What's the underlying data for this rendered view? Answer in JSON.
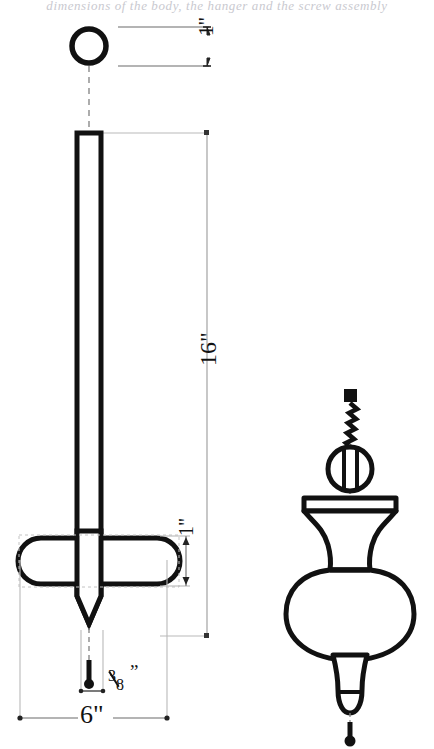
{
  "page": {
    "background_color": "#ffffff",
    "ink_color": "#111111",
    "dim_line_color": "#6b6b6b",
    "construction_line_color": "#b9b9b9",
    "cut_off_caption_text": "dimensions of the body, the hanger and the screw assembly"
  },
  "dimensions": {
    "top_ball_diameter": "1\"",
    "spike_length": "16\"",
    "crossbar_height": "1\"",
    "spike_width": "3\"",
    "crossbar_width": "6\"",
    "fraction_numerator": "3",
    "fraction_denominator": "8",
    "inch_mark": "”"
  },
  "left_view": {
    "name": "side elevation with dimensions",
    "parts": [
      {
        "id": "top-ring",
        "label": "ring"
      },
      {
        "id": "spike-shaft",
        "label": "tapered spike shaft"
      },
      {
        "id": "crossbar",
        "label": "rounded crossbar"
      },
      {
        "id": "spike-tip",
        "label": "pointed tip"
      }
    ]
  },
  "right_view": {
    "name": "finial and fastener detail",
    "parts": [
      {
        "id": "drill-bit",
        "label": "drill bit"
      },
      {
        "id": "screw-head",
        "label": "slotted screw head"
      },
      {
        "id": "finial",
        "label": "turned urn finial"
      },
      {
        "id": "centerline-dot",
        "label": "centerline terminator dot"
      }
    ]
  }
}
